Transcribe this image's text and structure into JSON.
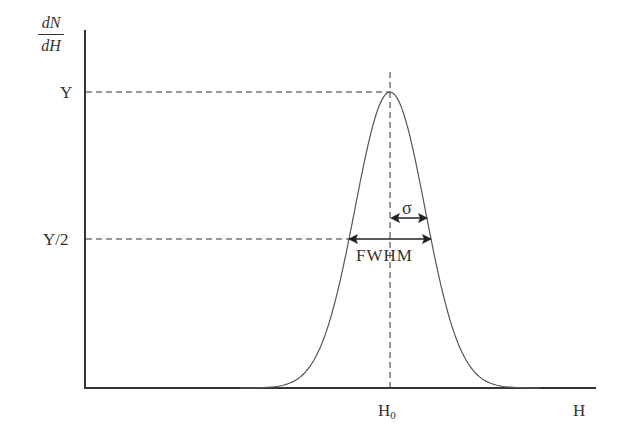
{
  "chart_data": {
    "type": "line",
    "ylabel": {
      "numerator": "dN",
      "denominator": "dH"
    },
    "xlabel": "H",
    "y_ticks": [
      "Y",
      "Y/2"
    ],
    "x_ticks": [
      "H0"
    ],
    "annotations": [
      "σ",
      "FWHM"
    ],
    "curve": "gaussian peak at H0 with height Y; half maximum Y/2 width FWHM; sigma half-width arrow",
    "grid": false
  },
  "labels": {
    "y_num": "dN",
    "y_den": "dH",
    "y_peak": "Y",
    "y_half": "Y/2",
    "x_center": "H",
    "x_center_sub": "0",
    "x_axis": "H",
    "sigma": "σ",
    "fwhm": "FWHM"
  },
  "colors": {
    "ink": "#333333",
    "curve": "#555555"
  }
}
